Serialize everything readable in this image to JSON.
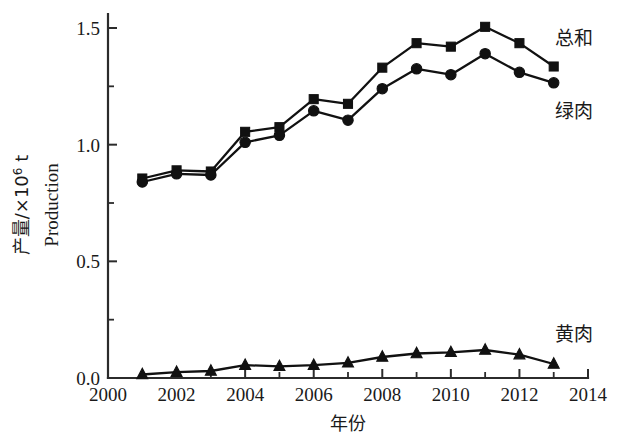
{
  "axes": {
    "y_title_cjk": "产量/×10⁶ t",
    "y_title_cjk_main": "产量/×10",
    "y_title_cjk_exp": "6",
    "y_title_cjk_unit": " t",
    "y_title_en": "Production",
    "x_title_cjk": "年份",
    "y_ticks": [
      "0.0",
      "0.5",
      "1.0",
      "1.5"
    ],
    "x_ticks": [
      "2000",
      "2002",
      "2004",
      "2006",
      "2008",
      "2010",
      "2012",
      "2014"
    ]
  },
  "series_labels": {
    "total": "总和",
    "green": "绿肉",
    "yellow": "黄肉"
  },
  "colors": {
    "ink": "#111111",
    "axis": "#2b2b2b",
    "background": "#ffffff"
  },
  "chart_data": {
    "type": "line",
    "title": "",
    "xlabel": "年份",
    "ylabel": "产量/×10⁶ t  Production",
    "xlim": [
      2000,
      2014
    ],
    "ylim": [
      0.0,
      1.55
    ],
    "yticks": [
      0.0,
      0.5,
      1.0,
      1.5
    ],
    "yticks_minor": [
      0.25,
      0.75,
      1.25
    ],
    "xticks": [
      2000,
      2002,
      2004,
      2006,
      2008,
      2010,
      2012,
      2014
    ],
    "xticks_minor": [
      2001,
      2003,
      2005,
      2007,
      2009,
      2011,
      2013
    ],
    "grid": false,
    "legend_position": "right-inline",
    "x": [
      2001,
      2002,
      2003,
      2004,
      2005,
      2006,
      2007,
      2008,
      2009,
      2010,
      2011,
      2012,
      2013
    ],
    "series": [
      {
        "name": "总和",
        "name_en": "Total",
        "marker": "square",
        "values": [
          0.855,
          0.89,
          0.885,
          1.055,
          1.075,
          1.195,
          1.175,
          1.33,
          1.435,
          1.42,
          1.505,
          1.435,
          1.335
        ]
      },
      {
        "name": "绿肉",
        "name_en": "Green flesh",
        "marker": "circle",
        "values": [
          0.84,
          0.875,
          0.87,
          1.01,
          1.04,
          1.145,
          1.105,
          1.24,
          1.325,
          1.3,
          1.39,
          1.31,
          1.265
        ]
      },
      {
        "name": "黄肉",
        "name_en": "Yellow flesh",
        "marker": "triangle",
        "values": [
          0.015,
          0.025,
          0.03,
          0.055,
          0.05,
          0.055,
          0.065,
          0.09,
          0.105,
          0.11,
          0.12,
          0.1,
          0.06
        ]
      }
    ]
  }
}
